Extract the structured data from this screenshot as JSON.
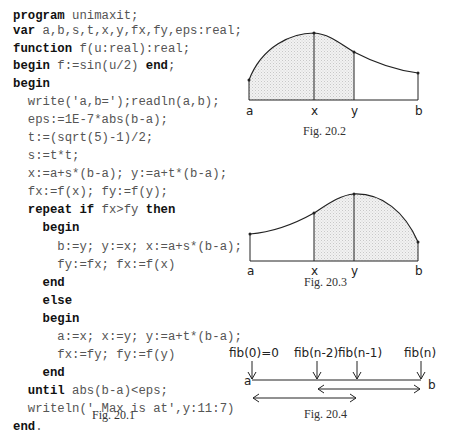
{
  "program": {
    "lines": [
      {
        "indent": "",
        "parts": [
          {
            "k": "program"
          },
          {
            "t": " unimaxit;"
          }
        ]
      },
      {
        "indent": "",
        "parts": [
          {
            "k": "var"
          },
          {
            "t": " a,b,s,t,x,y,fx,fy,eps:real;"
          }
        ]
      },
      {
        "indent": "",
        "parts": [
          {
            "k": "function"
          },
          {
            "t": " f(u:real):real;"
          }
        ]
      },
      {
        "indent": "",
        "parts": [
          {
            "k": "begin"
          },
          {
            "t": " f:=sin(u/2) "
          },
          {
            "k": "end"
          },
          {
            "t": ";"
          }
        ]
      },
      {
        "indent": "",
        "parts": [
          {
            "k": "begin"
          }
        ]
      },
      {
        "indent": "  ",
        "parts": [
          {
            "t": "write('a,b=');readln(a,b);"
          }
        ]
      },
      {
        "indent": "  ",
        "parts": [
          {
            "t": "eps:=1E-7*abs(b-a);"
          }
        ]
      },
      {
        "indent": "  ",
        "parts": [
          {
            "t": "t:=(sqrt(5)-1)/2;"
          }
        ]
      },
      {
        "indent": "  ",
        "parts": [
          {
            "t": "s:=t*t;"
          }
        ]
      },
      {
        "indent": "  ",
        "parts": [
          {
            "t": "x:=a+s*(b-a); y:=a+t*(b-a);"
          }
        ]
      },
      {
        "indent": "  ",
        "parts": [
          {
            "t": "fx:=f(x); fy:=f(y);"
          }
        ]
      },
      {
        "indent": "  ",
        "parts": [
          {
            "k": "repeat if"
          },
          {
            "t": " fx>fy "
          },
          {
            "k": "then"
          }
        ]
      },
      {
        "indent": "    ",
        "parts": [
          {
            "k": "begin"
          }
        ]
      },
      {
        "indent": "      ",
        "parts": [
          {
            "t": "b:=y; y:=x; x:=a+s*(b-a);"
          }
        ]
      },
      {
        "indent": "      ",
        "parts": [
          {
            "t": "fy:=fx; fx:=f(x)"
          }
        ]
      },
      {
        "indent": "    ",
        "parts": [
          {
            "k": "end"
          }
        ]
      },
      {
        "indent": "    ",
        "parts": [
          {
            "k": "else"
          }
        ]
      },
      {
        "indent": "    ",
        "parts": [
          {
            "k": "begin"
          }
        ]
      },
      {
        "indent": "      ",
        "parts": [
          {
            "t": "a:=x; x:=y; y:=a+t*(b-a);"
          }
        ]
      },
      {
        "indent": "      ",
        "parts": [
          {
            "t": "fx:=fy; fy:=f(y)"
          }
        ]
      },
      {
        "indent": "    ",
        "parts": [
          {
            "k": "end"
          }
        ]
      },
      {
        "indent": "  ",
        "parts": [
          {
            "k": "until"
          },
          {
            "t": " abs(b-a)<eps;"
          }
        ]
      },
      {
        "indent": "  ",
        "parts": [
          {
            "t": "writeln(' Max is at',y:11:7)"
          }
        ]
      },
      {
        "indent": "",
        "parts": [
          {
            "k": "end"
          },
          {
            "t": "."
          }
        ]
      }
    ],
    "line_tops": [
      8,
      23,
      41,
      58,
      76,
      94,
      112,
      130,
      148,
      166,
      184,
      202,
      220,
      239,
      257,
      275,
      293,
      311,
      329,
      347,
      365,
      383,
      401,
      419
    ]
  },
  "captions": {
    "fig1": "Fig. 20.1",
    "fig2": "Fig. 20.2",
    "fig3": "Fig. 20.3",
    "fig4": "Fig. 20.4"
  },
  "fig2": {
    "labels": {
      "a": "a",
      "x": "x",
      "y": "y",
      "b": "b"
    }
  },
  "fig3": {
    "labels": {
      "a": "a",
      "x": "x",
      "y": "y",
      "b": "b"
    }
  },
  "fig4": {
    "labels": {
      "fib0": "fib(0)=0",
      "fibn2": "fib(n-2)",
      "fibn1": "fib(n-1)",
      "fibn": "fib(n)",
      "a": "a",
      "b": "b"
    }
  }
}
